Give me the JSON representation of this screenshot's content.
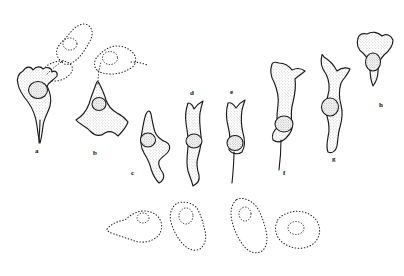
{
  "figure": {
    "kind": "scientific-line-drawing-plate",
    "background_color": "#ffffff",
    "ink_color": "#1a1a1a",
    "stipple_color": "#8a8a8a",
    "width": 404,
    "height": 276,
    "panel_count": 8
  },
  "labels": [
    {
      "id": "a",
      "text": "a",
      "x": 35,
      "y": 148
    },
    {
      "id": "b",
      "text": "b",
      "x": 93,
      "y": 150
    },
    {
      "id": "c",
      "text": "c",
      "x": 131,
      "y": 170
    },
    {
      "id": "d",
      "text": "d",
      "x": 190,
      "y": 90
    },
    {
      "id": "e",
      "text": "e",
      "x": 230,
      "y": 89
    },
    {
      "id": "f",
      "text": "f",
      "x": 283,
      "y": 170
    },
    {
      "id": "g",
      "text": "g",
      "x": 332,
      "y": 156
    },
    {
      "id": "h",
      "text": "h",
      "x": 379,
      "y": 102
    }
  ],
  "cells": [
    {
      "id": "a",
      "label": "a",
      "outline": "solid",
      "has_nucleus": true,
      "nucleus": {
        "cx": 38,
        "cy": 90,
        "rx": 9.5,
        "ry": 8.5,
        "shape": "round"
      },
      "body": "M 18 84 C 16 78 19 73 23 71 C 26 66 31 66 33 70 C 36 66 41 66 43 69 C 47 66 52 68 52 72 C 55 70 58 72 57 76 C 54 80 49 82 47 86 C 50 92 52 99 50 106 C 48 113 44 118 43 126 C 42 134 41 140 40 143 C 39 140 38 134 37 126 C 36 117 33 109 28 102 C 23 96 19 90 18 84 Z",
      "tail": "M 40 120 C 40 128 39 136 39 143",
      "ghost_link": "M 47 74 C 52 69 58 64 64 60"
    },
    {
      "id": "b",
      "label": "b",
      "outline": "solid",
      "has_nucleus": true,
      "nucleus": {
        "cx": 99,
        "cy": 104,
        "rx": 7,
        "ry": 6.5,
        "shape": "round"
      },
      "body": "M 96 84 C 94 90 91 97 89 104 C 86 112 81 117 76 120 C 80 125 86 126 90 131 C 95 136 100 137 105 133 C 110 130 114 132 118 136 C 122 132 126 128 128 122 C 125 118 121 115 117 113 C 112 110 108 106 106 100 C 104 93 101 87 99 83 C 98 81 97 81 96 84 Z",
      "tail": "",
      "ghost_link": "M 98 84 C 98 76 99 69 101 62"
    },
    {
      "id": "c",
      "label": "c",
      "outline": "solid",
      "has_nucleus": true,
      "nucleus": {
        "cx": 148,
        "cy": 140,
        "rx": 7.5,
        "ry": 7,
        "shape": "round"
      },
      "body": "M 146 114 C 144 119 143 126 142 132 C 140 140 141 148 144 153 C 147 158 150 163 151 169 C 153 175 156 180 159 183 C 163 181 165 177 163 173 C 160 169 158 165 159 161 C 161 157 165 156 168 152 C 171 148 170 144 166 142 C 161 140 157 137 155 132 C 153 126 152 119 151 114 C 150 110 148 110 146 114 Z",
      "tail": "",
      "ghost_link": ""
    },
    {
      "id": "d",
      "label": "d",
      "outline": "solid",
      "has_nucleus": true,
      "nucleus": {
        "cx": 194,
        "cy": 141,
        "rx": 8,
        "ry": 7,
        "shape": "oval"
      },
      "body": "M 188 103 C 186 109 185 116 186 123 C 187 131 189 139 188 147 C 187 156 186 164 188 171 C 190 177 192 182 193 186 C 197 184 200 180 199 175 C 197 169 196 163 198 157 C 200 150 202 143 201 136 C 200 128 199 120 200 113 C 201 108 202 104 203 101 C 199 103 196 106 194 109 C 193 106 191 103 188 103 Z",
      "tail": "",
      "ghost_link": ""
    },
    {
      "id": "e",
      "label": "e",
      "outline": "solid",
      "has_nucleus": true,
      "nucleus": {
        "cx": 235,
        "cy": 143,
        "rx": 8,
        "ry": 7.5,
        "shape": "oval"
      },
      "body": "M 228 103 C 226 110 226 118 228 126 C 230 134 231 142 229 150 C 232 154 238 155 242 152 C 245 147 245 140 243 133 C 241 125 241 117 242 110 C 243 106 244 103 245 100 C 241 102 238 105 236 108 C 234 105 231 102 228 103 Z",
      "tail": "M 234 152 C 234 162 233 173 232 183",
      "ghost_link": ""
    },
    {
      "id": "f",
      "label": "f",
      "outline": "solid",
      "has_nucleus": true,
      "nucleus": {
        "cx": 284,
        "cy": 124,
        "rx": 9,
        "ry": 8,
        "shape": "oval"
      },
      "body": "M 272 64 C 270 70 271 77 274 82 C 277 89 279 97 278 105 C 277 113 276 120 278 127 C 274 130 271 135 273 140 C 277 143 282 142 286 138 C 290 134 293 129 292 124 C 291 117 291 109 293 102 C 295 94 296 86 295 79 C 298 76 302 74 305 71 C 301 68 296 68 292 70 C 289 66 284 63 279 63 C 276 62 273 62 272 64 Z",
      "tail": "M 281 140 C 281 152 280 162 279 170",
      "ghost_link": ""
    },
    {
      "id": "g",
      "label": "g",
      "outline": "solid",
      "has_nucleus": true,
      "nucleus": {
        "cx": 330,
        "cy": 107,
        "rx": 8.5,
        "ry": 9,
        "shape": "oval"
      },
      "body": "M 322 55 C 320 62 322 69 326 74 C 329 80 330 88 328 95 C 326 102 325 109 327 116 C 329 123 330 130 328 137 C 327 143 326 148 328 152 C 332 154 336 151 337 146 C 338 140 338 133 340 127 C 342 120 343 112 341 105 C 339 98 339 90 341 83 C 344 78 348 74 350 69 C 346 67 341 68 337 71 C 334 65 329 60 324 57 C 323 55 322 54 322 55 Z",
      "tail": "",
      "ghost_link": ""
    },
    {
      "id": "h",
      "label": "h",
      "outline": "solid",
      "has_nucleus": true,
      "nucleus": {
        "cx": 373,
        "cy": 62,
        "rx": 7.5,
        "ry": 9,
        "shape": "oval"
      },
      "body": "M 358 38 C 356 44 358 50 363 53 C 367 57 370 62 370 68 C 370 75 371 81 373 86 C 376 82 378 77 378 71 C 378 65 380 59 384 55 C 389 51 393 46 393 40 C 391 35 386 33 382 36 C 378 32 372 31 367 34 C 363 33 359 34 358 38 Z",
      "tail": "",
      "ghost_link": ""
    }
  ],
  "ghosts": [
    {
      "id": "ghost-a-upper",
      "belongs_to": "a",
      "outline": "dotted",
      "has_nucleus": true,
      "nucleus": {
        "cx": 70,
        "cy": 44,
        "rx": 7,
        "ry": 6
      },
      "path": "M 62 62 C 57 58 55 52 58 47 C 61 42 66 38 70 33 C 74 28 79 24 85 24 C 90 25 93 30 92 35 C 91 41 87 46 84 51 C 80 57 75 62 69 64 C 66 65 63 64 62 62 Z"
    },
    {
      "id": "ghost-a-lower",
      "belongs_to": "a",
      "outline": "dotted",
      "has_nucleus": false,
      "nucleus": null,
      "path": "M 44 76 C 42 71 45 66 50 64 C 56 61 62 60 67 62 C 72 64 74 69 71 73 C 67 78 61 81 55 81 C 50 81 46 80 44 76 Z"
    },
    {
      "id": "ghost-b-upper",
      "belongs_to": "b",
      "outline": "dotted",
      "has_nucleus": true,
      "nucleus": {
        "cx": 110,
        "cy": 58,
        "rx": 7.5,
        "ry": 6.5
      },
      "path": "M 97 70 C 93 66 94 59 99 55 C 104 50 110 46 117 46 C 124 46 130 49 134 54 C 137 59 136 65 131 68 C 125 72 118 74 111 74 C 105 74 100 73 97 70 Z"
    },
    {
      "id": "ghost-b-tail",
      "belongs_to": "b",
      "outline": "dotted",
      "has_nucleus": false,
      "nucleus": null,
      "path": "M 131 62 C 137 62 142 63 147 65"
    },
    {
      "id": "ghost-bottom-1",
      "outline": "dotted",
      "has_nucleus": true,
      "nucleus": {
        "cx": 143,
        "cy": 218,
        "rx": 6,
        "ry": 5
      },
      "path": "M 107 229 C 111 224 118 221 125 220 C 130 215 137 211 144 211 C 152 211 159 215 161 222 C 163 229 160 236 154 239 C 147 243 139 243 132 240 C 126 238 120 236 114 234 C 110 233 107 231 107 229 Z"
    },
    {
      "id": "ghost-bottom-2",
      "outline": "dotted",
      "has_nucleus": true,
      "nucleus": {
        "cx": 186,
        "cy": 216,
        "rx": 7,
        "ry": 8
      },
      "path": "M 176 204 C 171 208 169 215 171 222 C 173 230 177 237 182 243 C 187 249 194 252 200 249 C 205 245 207 238 205 231 C 203 223 201 215 197 208 C 193 203 182 200 176 204 Z"
    },
    {
      "id": "ghost-bottom-3",
      "outline": "dotted",
      "has_nucleus": true,
      "nucleus": {
        "cx": 245,
        "cy": 214,
        "rx": 6,
        "ry": 7
      },
      "path": "M 236 200 C 231 205 230 213 232 221 C 234 230 238 238 243 245 C 248 252 256 255 262 251 C 267 247 268 239 266 231 C 264 222 261 213 256 206 C 251 200 241 196 236 200 Z"
    },
    {
      "id": "ghost-bottom-4",
      "outline": "dotted",
      "has_nucleus": true,
      "nucleus": {
        "cx": 296,
        "cy": 228,
        "rx": 8,
        "ry": 6.5
      },
      "path": "M 277 222 C 274 229 276 237 282 242 C 288 247 296 249 303 248 C 311 247 317 242 319 235 C 321 228 318 220 312 216 C 305 211 296 210 288 213 C 282 215 278 218 277 222 Z"
    }
  ]
}
